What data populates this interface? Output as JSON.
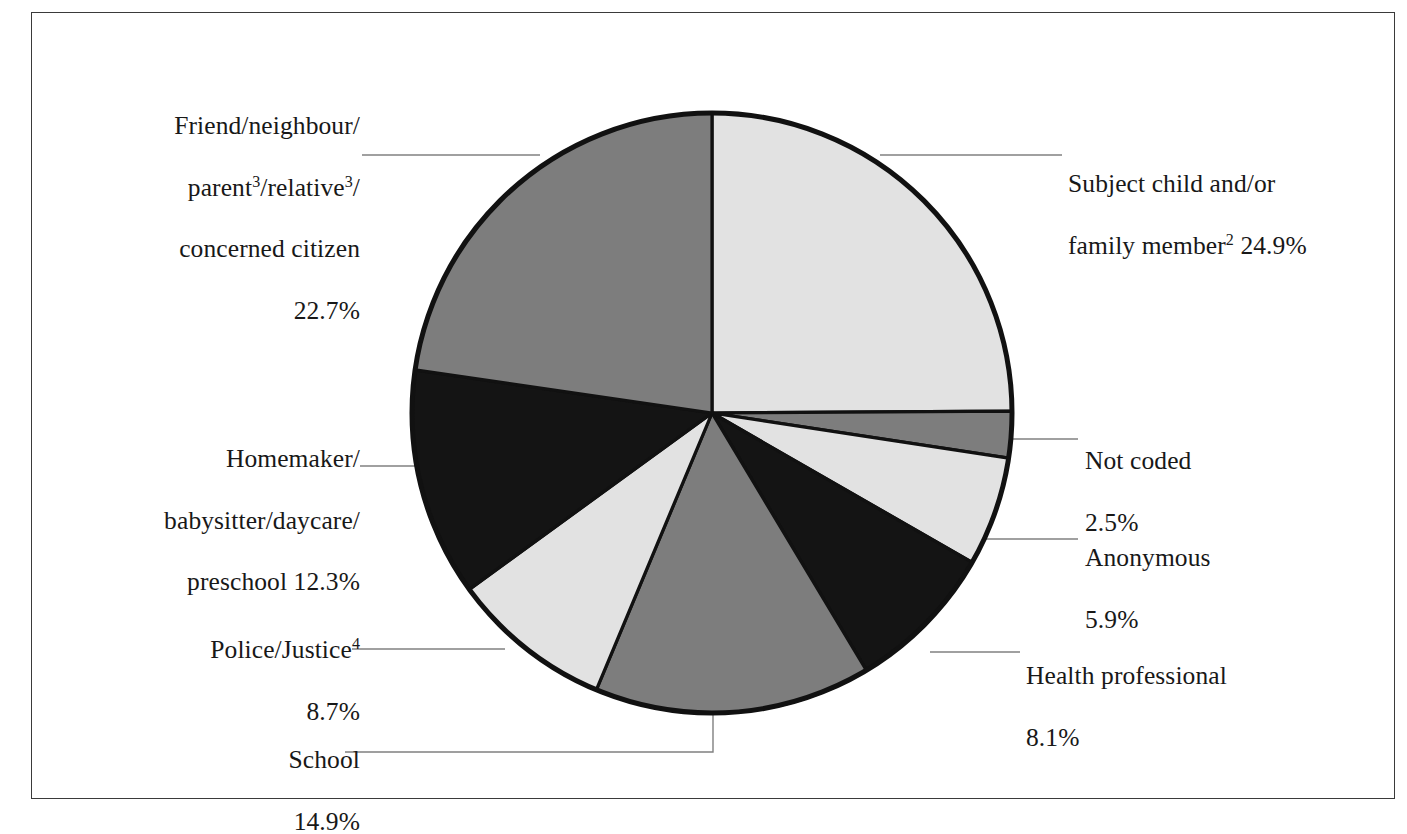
{
  "figure": {
    "background_color": "#ffffff",
    "frame_color": "#3a3a3a"
  },
  "chart_data": {
    "type": "pie",
    "title": "",
    "subtitle": "",
    "xlabel": "",
    "ylabel": "",
    "legend_position": "none",
    "grid": false,
    "start_angle_deg": 0,
    "direction": "clockwise",
    "units": "percent",
    "total": 100.0,
    "center": {
      "x": 712,
      "y": 413
    },
    "radius": 300,
    "categories": [
      "Subject child and/or family member2 24.9%",
      "Not coded 2.5%",
      "Anonymous 5.9%",
      "Health professional 8.1%",
      "School 14.9%",
      "Police/Justice4 8.7%",
      "Homemaker/babysitter/daycare/preschool 12.3%",
      "Friend/neighbour/parent3/relative3/concerned citizen 22.7%"
    ],
    "values": [
      24.9,
      2.5,
      5.9,
      8.1,
      14.9,
      8.7,
      12.3,
      22.7
    ],
    "colors": [
      "#e2e2e2",
      "#7d7d7d",
      "#e2e2e2",
      "#141414",
      "#7d7d7d",
      "#e2e2e2",
      "#141414",
      "#7d7d7d"
    ],
    "slice_edge_color": "#111111",
    "outline_color": "#111111",
    "slices": [
      {
        "name": "subject-child",
        "label": "Subject child and/or family member",
        "footnote": "2",
        "value": 24.9,
        "value_text": "24.9%",
        "color": "#e2e2e2"
      },
      {
        "name": "not-coded",
        "label": "Not coded",
        "footnote": "",
        "value": 2.5,
        "value_text": "2.5%",
        "color": "#7d7d7d"
      },
      {
        "name": "anonymous",
        "label": "Anonymous",
        "footnote": "",
        "value": 5.9,
        "value_text": "5.9%",
        "color": "#e2e2e2"
      },
      {
        "name": "health-professional",
        "label": "Health professional",
        "footnote": "",
        "value": 8.1,
        "value_text": "8.1%",
        "color": "#141414"
      },
      {
        "name": "school",
        "label": "School",
        "footnote": "",
        "value": 14.9,
        "value_text": "14.9%",
        "color": "#7d7d7d"
      },
      {
        "name": "police-justice",
        "label": "Police/Justice",
        "footnote": "4",
        "value": 8.7,
        "value_text": "8.7%",
        "color": "#e2e2e2"
      },
      {
        "name": "homemaker",
        "label": "Homemaker/babysitter/daycare/preschool",
        "footnote": "",
        "value": 12.3,
        "value_text": "12.3%",
        "color": "#141414"
      },
      {
        "name": "friend-neighbour",
        "label": "Friend/neighbour/parent/relative/concerned citizen",
        "footnote": "3",
        "value": 22.7,
        "value_text": "22.7%",
        "color": "#7d7d7d"
      }
    ]
  },
  "labels": {
    "friend": {
      "line1": "Friend/neighbour/",
      "line2_a": "parent",
      "line2_sup1": "3",
      "line2_b": "/relative",
      "line2_sup2": "3",
      "line2_c": "/",
      "line3": "concerned citizen",
      "line4": "22.7%"
    },
    "homemaker": {
      "line1": "Homemaker/",
      "line2": "babysitter/daycare/",
      "line3": "preschool 12.3%"
    },
    "police": {
      "line1_a": "Police/Justice",
      "line1_sup": "4",
      "line2": "8.7%"
    },
    "school": {
      "line1": "School",
      "line2": "14.9%"
    },
    "subject": {
      "line1": "Subject child and/or",
      "line2_a": "family member",
      "line2_sup": "2",
      "line2_b": " 24.9%"
    },
    "notcoded": {
      "line1": "Not coded",
      "line2": "2.5%"
    },
    "anonymous": {
      "line1": "Anonymous",
      "line2": "5.9%"
    },
    "health": {
      "line1": "Health professional",
      "line2": "8.1%"
    }
  }
}
